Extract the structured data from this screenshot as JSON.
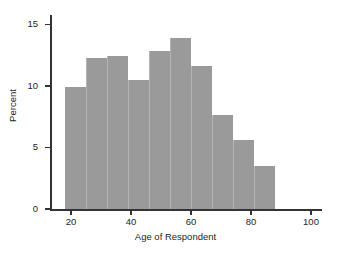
{
  "chart_data": {
    "type": "bar",
    "title": "",
    "subtitle": "",
    "xlabel": "Age of Respondent",
    "ylabel": "Percent",
    "xlim": [
      13,
      103
    ],
    "ylim": [
      0,
      15.6
    ],
    "grid": false,
    "legend": null,
    "bin_edges": [
      18,
      25,
      32,
      39,
      46,
      53,
      60,
      67,
      74,
      81,
      88
    ],
    "categories": [
      "18-25",
      "25-32",
      "32-39",
      "39-46",
      "46-53",
      "53-60",
      "60-67",
      "67-74",
      "74-81",
      "81-88"
    ],
    "values": [
      9.9,
      12.3,
      12.4,
      10.5,
      12.8,
      13.9,
      11.6,
      7.6,
      5.6,
      3.5
    ],
    "bar_color": "#9a9a9a",
    "bar_edge_color": "#b4b4b4",
    "axis_color": "#333333",
    "background_color": "#ffffff",
    "x_ticks": [
      {
        "value": 20,
        "label": "20"
      },
      {
        "value": 40,
        "label": "40"
      },
      {
        "value": 60,
        "label": "60"
      },
      {
        "value": 80,
        "label": "80"
      },
      {
        "value": 100,
        "label": "100"
      }
    ],
    "y_ticks": [
      {
        "value": 0,
        "label": "0"
      },
      {
        "value": 5,
        "label": "5"
      },
      {
        "value": 10,
        "label": "10"
      },
      {
        "value": 15,
        "label": "15"
      }
    ]
  }
}
